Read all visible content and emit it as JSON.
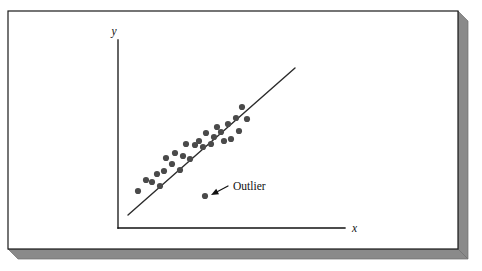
{
  "figure": {
    "kind": "scatter-plot-illustration",
    "caption_text": "",
    "frame": {
      "panel_fill": "#ffffff",
      "border_color": "#1a1a1a",
      "shadow_color": "#8a8a8a",
      "shadow_edge_color": "#6e6e6e",
      "panel_x": 8,
      "panel_y": 11,
      "panel_width": 450,
      "panel_height": 238,
      "shadow_offset": 10
    }
  },
  "axes": {
    "y_axis_label": "y",
    "x_axis_label": "x",
    "axis_color": "#111111",
    "axis_line_width": 1.3,
    "origin_x": 118,
    "origin_y": 228,
    "y_axis_top": 40,
    "x_axis_right": 345,
    "y_label_pos": {
      "x": 114,
      "y": 35
    },
    "x_label_pos": {
      "x": 352,
      "y": 232
    }
  },
  "annotation": {
    "label": "Outlier",
    "label_pos": {
      "x": 233,
      "y": 190
    },
    "arrow_from": {
      "x": 228,
      "y": 186
    },
    "arrow_to": {
      "x": 211,
      "y": 195
    },
    "arrow_color": "#111111"
  },
  "chart_data": {
    "type": "scatter",
    "title": "",
    "xlabel": "x",
    "ylabel": "y",
    "xlim": [
      118,
      345
    ],
    "ylim": [
      40,
      228
    ],
    "grid": false,
    "legend": null,
    "annotations": [
      {
        "text": "Outlier",
        "target_point_index": 28
      }
    ],
    "point_color": "#4a4a4a",
    "point_radius": 3.1,
    "trend_line": {
      "x1": 128,
      "y1": 215,
      "x2": 295,
      "y2": 68,
      "color": "#2b2b2b",
      "width": 1.4
    },
    "points": [
      {
        "x": 138,
        "y": 191
      },
      {
        "x": 146,
        "y": 180
      },
      {
        "x": 152,
        "y": 182
      },
      {
        "x": 157,
        "y": 174
      },
      {
        "x": 160,
        "y": 186
      },
      {
        "x": 164,
        "y": 171
      },
      {
        "x": 166,
        "y": 158
      },
      {
        "x": 172,
        "y": 164
      },
      {
        "x": 175,
        "y": 153
      },
      {
        "x": 180,
        "y": 170
      },
      {
        "x": 183,
        "y": 156
      },
      {
        "x": 186,
        "y": 144
      },
      {
        "x": 190,
        "y": 159
      },
      {
        "x": 195,
        "y": 145
      },
      {
        "x": 199,
        "y": 141
      },
      {
        "x": 203,
        "y": 147
      },
      {
        "x": 206,
        "y": 133
      },
      {
        "x": 211,
        "y": 144
      },
      {
        "x": 214,
        "y": 137
      },
      {
        "x": 217,
        "y": 127
      },
      {
        "x": 221,
        "y": 132
      },
      {
        "x": 224,
        "y": 141
      },
      {
        "x": 228,
        "y": 124
      },
      {
        "x": 231,
        "y": 139
      },
      {
        "x": 236,
        "y": 118
      },
      {
        "x": 239,
        "y": 131
      },
      {
        "x": 242,
        "y": 107
      },
      {
        "x": 247,
        "y": 119
      },
      {
        "x": 205,
        "y": 196
      }
    ],
    "outlier_index": 28,
    "n_points": 29
  }
}
